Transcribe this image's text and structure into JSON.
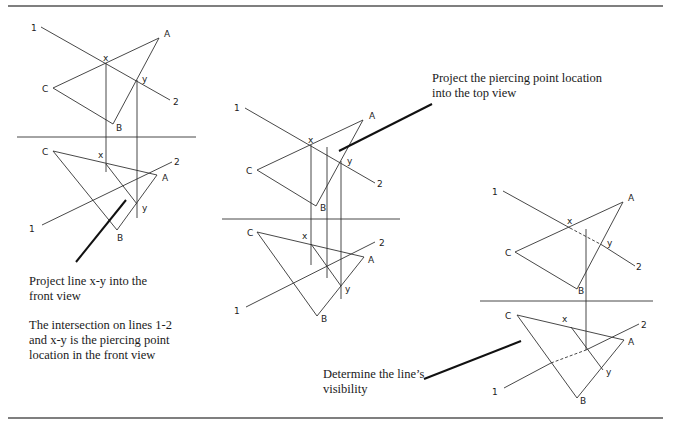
{
  "figure": {
    "panels": [
      {
        "name": "step-1",
        "labels": {
          "one_top": "1",
          "two_top": "2",
          "a_top": "A",
          "b_top": "B",
          "c_top": "C",
          "x_top": "x",
          "y_top": "y",
          "one_front": "1",
          "two_front": "2",
          "a_front": "A",
          "b_front": "B",
          "c_front": "C",
          "x_front": "x",
          "y_front": "y"
        },
        "caption_1": [
          "Project line x-y into the",
          "front view"
        ],
        "caption_2": [
          "The intersection on lines 1-2",
          "and x-y is the piercing point",
          "location in the front view"
        ]
      },
      {
        "name": "step-2",
        "labels": {
          "one_top": "1",
          "two_top": "2",
          "a_top": "A",
          "b_top": "B",
          "c_top": "C",
          "x_top": "x",
          "y_top": "y",
          "one_front": "1",
          "two_front": "2",
          "a_front": "A",
          "b_front": "B",
          "c_front": "C",
          "x_front": "x",
          "y_front": "y"
        },
        "caption": [
          "Project the piercing point location",
          "into the top view"
        ]
      },
      {
        "name": "step-3",
        "labels": {
          "one_top": "1",
          "two_top": "2",
          "a_top": "A",
          "b_top": "B",
          "c_top": "C",
          "x_top": "x",
          "y_top": "y",
          "one_front": "1",
          "two_front": "2",
          "a_front": "A",
          "b_front": "B",
          "c_front": "C",
          "x_front": "x",
          "y_front": "y"
        },
        "caption": [
          "Determine the line’s",
          "visibility"
        ]
      }
    ]
  }
}
